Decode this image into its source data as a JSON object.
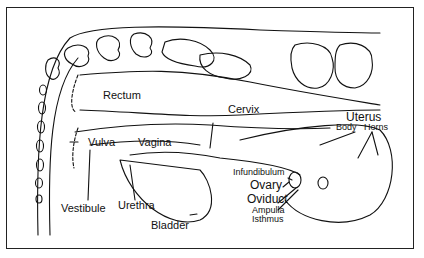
{
  "figure": {
    "labels": {
      "rectum": "Rectum",
      "cervix": "Cervix",
      "uterus": "Uterus",
      "uterus_body": "Body",
      "uterus_horns": "Horns",
      "vulva": "Vulva",
      "vagina": "Vagina",
      "vestibule": "Vestibule",
      "urethra": "Urethra",
      "bladder": "Bladder",
      "infundibulum": "Infundibulum",
      "ovary": "Ovary",
      "oviduct": "Oviduct",
      "ampulla": "Ampulla",
      "isthmus": "Isthmus"
    }
  }
}
